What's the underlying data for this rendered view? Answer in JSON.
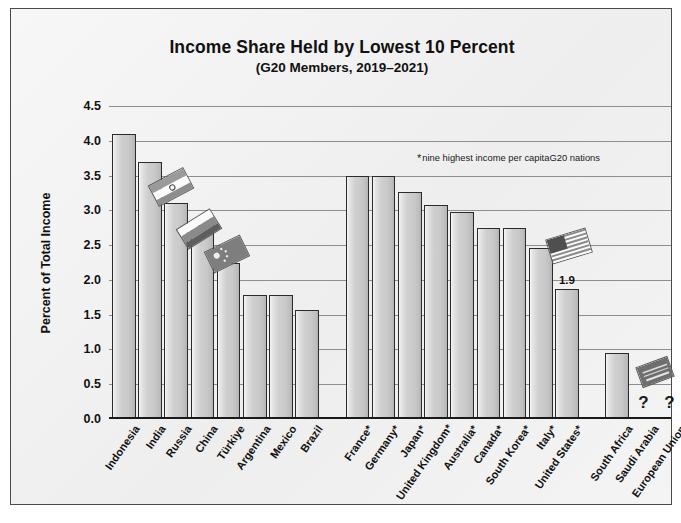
{
  "chart_data": {
    "type": "bar",
    "title": "Income Share Held by Lowest 10 Percent",
    "subtitle": "(G20 Members, 2019–2021)",
    "xlabel": "",
    "ylabel": "Percent of Total Income",
    "ylim": [
      0,
      4.5
    ],
    "ytick_step": 0.5,
    "yticks": [
      "4.5",
      "4.0",
      "3.5",
      "3.0",
      "2.5",
      "2.0",
      "1.5",
      "1.0",
      "0.5",
      "0.0"
    ],
    "grid": true,
    "legend": "none",
    "annotation": "nine highest income per capitaG20 nations",
    "annotation_marker": "*",
    "categories": [
      "Indonesia",
      "India",
      "Russia",
      "China",
      "Türkiye",
      "Argentina",
      "Mexico",
      "Brazil",
      "France*",
      "Germany*",
      "Japan*",
      "United Kingdom*",
      "Australia*",
      "Canada*",
      "South Korea*",
      "Italy*",
      "United States*",
      "South Africa",
      "Saudi Arabia",
      "European Union"
    ],
    "values": [
      4.1,
      3.7,
      3.11,
      2.79,
      2.25,
      1.78,
      1.78,
      1.57,
      3.5,
      3.5,
      3.27,
      3.08,
      2.98,
      2.75,
      2.75,
      2.46,
      1.87,
      0.95,
      null,
      null
    ],
    "data_labels": {
      "United States*": "1.9"
    },
    "missing_marker": "?",
    "missing_categories": [
      "Saudi Arabia",
      "European Union"
    ],
    "groups": [
      {
        "name": "emerging",
        "start": 0,
        "count": 8
      },
      {
        "name": "high-income",
        "start": 8,
        "count": 9
      },
      {
        "name": "other",
        "start": 17,
        "count": 3
      }
    ]
  },
  "bars": [
    {
      "label": "Indonesia",
      "value": 4.1,
      "group": 0,
      "star": false
    },
    {
      "label": "India",
      "value": 3.7,
      "group": 0,
      "star": false
    },
    {
      "label": "Russia",
      "value": 3.11,
      "group": 0,
      "star": false
    },
    {
      "label": "China",
      "value": 2.79,
      "group": 0,
      "star": false
    },
    {
      "label": "Türkiye",
      "value": 2.25,
      "group": 0,
      "star": false
    },
    {
      "label": "Argentina",
      "value": 1.78,
      "group": 0,
      "star": false
    },
    {
      "label": "Mexico",
      "value": 1.78,
      "group": 0,
      "star": false
    },
    {
      "label": "Brazil",
      "value": 1.57,
      "group": 0,
      "star": false
    },
    {
      "label": "France",
      "value": 3.5,
      "group": 1,
      "star": true
    },
    {
      "label": "Germany",
      "value": 3.5,
      "group": 1,
      "star": true
    },
    {
      "label": "Japan",
      "value": 3.27,
      "group": 1,
      "star": true
    },
    {
      "label": "United Kingdom",
      "value": 3.08,
      "group": 1,
      "star": true
    },
    {
      "label": "Australia",
      "value": 2.98,
      "group": 1,
      "star": true
    },
    {
      "label": "Canada",
      "value": 2.75,
      "group": 1,
      "star": true
    },
    {
      "label": "South Korea",
      "value": 2.75,
      "group": 1,
      "star": true
    },
    {
      "label": "Italy",
      "value": 2.46,
      "group": 1,
      "star": true
    },
    {
      "label": "United States",
      "value": 1.87,
      "group": 1,
      "star": true,
      "data_label": "1.9"
    },
    {
      "label": "South Africa",
      "value": 0.95,
      "group": 2,
      "star": false
    },
    {
      "label": "Saudi Arabia",
      "value": null,
      "group": 2,
      "star": false,
      "missing": "?"
    },
    {
      "label": "European Union",
      "value": null,
      "group": 2,
      "star": false,
      "missing": "?"
    }
  ],
  "flags": [
    {
      "country": "India",
      "name": "india-flag-icon"
    },
    {
      "country": "Russia",
      "name": "russia-flag-icon"
    },
    {
      "country": "China",
      "name": "china-flag-icon"
    },
    {
      "country": "United States",
      "name": "united-states-flag-icon"
    },
    {
      "country": "Saudi Arabia",
      "name": "saudi-arabia-flag-icon"
    }
  ],
  "colors": {
    "bar_fill_light": "#f0f0f0",
    "bar_fill_mid": "#c9c9c9",
    "bar_border": "#2b2b2b",
    "gridline": "#8e8e8e",
    "axis": "#1a1a1a",
    "text": "#111111",
    "panel_background": "#f2f2f2",
    "page_background": "#ffffff"
  }
}
